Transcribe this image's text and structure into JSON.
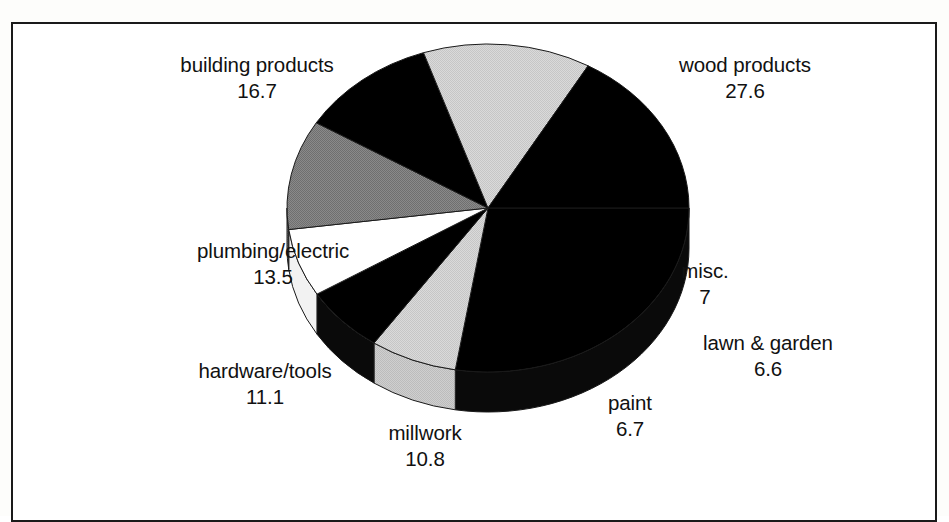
{
  "figure": {
    "border_color": "#1a1a1a",
    "background": "#ffffff"
  },
  "chart_data": {
    "type": "pie",
    "title": "",
    "subtitle": "",
    "xlabel": "",
    "ylabel": "",
    "units": "percent",
    "three_d": true,
    "legend_position": "none",
    "labels_inline": true,
    "categories": [
      "wood products",
      "misc.",
      "lawn & garden",
      "paint",
      "millwork",
      "hardware/tools",
      "plumbing/electric",
      "building products"
    ],
    "values": [
      27.6,
      7,
      6.6,
      6.7,
      10.8,
      11.1,
      13.5,
      16.7
    ],
    "value_labels": [
      "27.6",
      "7",
      "6.6",
      "6.7",
      "10.8",
      "11.1",
      "13.5",
      "16.7"
    ],
    "colors": [
      "#000000",
      "#d2d2d2",
      "#000000",
      "#ffffff",
      "#808080",
      "#000000",
      "#d2d2d2",
      "#000000"
    ],
    "total": 100.0,
    "slices": [
      {
        "name": "wood products",
        "value": 27.6,
        "value_label": "27.6",
        "color": "#000000"
      },
      {
        "name": "misc.",
        "value": 7,
        "value_label": "7",
        "color": "#d2d2d2"
      },
      {
        "name": "lawn & garden",
        "value": 6.6,
        "value_label": "6.6",
        "color": "#000000"
      },
      {
        "name": "paint",
        "value": 6.7,
        "value_label": "6.7",
        "color": "#ffffff"
      },
      {
        "name": "millwork",
        "value": 10.8,
        "value_label": "10.8",
        "color": "#808080"
      },
      {
        "name": "hardware/tools",
        "value": 11.1,
        "value_label": "11.1",
        "color": "#000000"
      },
      {
        "name": "plumbing/electric",
        "value": 13.5,
        "value_label": "13.5",
        "color": "#d2d2d2"
      },
      {
        "name": "building products",
        "value": 16.7,
        "value_label": "16.7",
        "color": "#000000"
      }
    ]
  },
  "labels": {
    "building_products": {
      "name": "building products",
      "value": "16.7"
    },
    "wood_products": {
      "name": "wood products",
      "value": "27.6"
    },
    "plumbing_electric": {
      "name": "plumbing/electric",
      "value": "13.5"
    },
    "misc": {
      "name": "misc.",
      "value": "7"
    },
    "lawn_garden": {
      "name": "lawn & garden",
      "value": "6.6"
    },
    "hardware_tools": {
      "name": "hardware/tools",
      "value": "11.1"
    },
    "paint": {
      "name": "paint",
      "value": "6.7"
    },
    "millwork": {
      "name": "millwork",
      "value": "10.8"
    }
  }
}
